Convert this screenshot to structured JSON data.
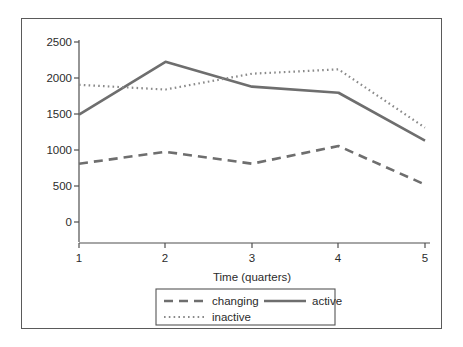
{
  "chart_data": {
    "type": "line",
    "title": "",
    "xlabel": "Time (quarters)",
    "ylabel": "",
    "x": [
      1,
      2,
      3,
      4,
      5
    ],
    "xtick_labels": [
      "1",
      "2",
      "3",
      "4",
      "5"
    ],
    "ytick_labels": [
      "0",
      "500",
      "1000",
      "1500",
      "2000",
      "2500"
    ],
    "ytick_values": [
      0,
      500,
      1000,
      1500,
      2000,
      2500
    ],
    "xlim": [
      1,
      5
    ],
    "ylim": [
      0,
      2500
    ],
    "grid": false,
    "legend_position": "bottom",
    "series": [
      {
        "name": "changing",
        "style": "dashed",
        "color": "#6e6e6e",
        "values": [
          810,
          975,
          810,
          1055,
          520
        ]
      },
      {
        "name": "active",
        "style": "solid",
        "color": "#6e6e6e",
        "values": [
          1490,
          2225,
          1880,
          1795,
          1130
        ]
      },
      {
        "name": "inactive",
        "style": "dotted",
        "color": "#8a8a8a",
        "values": [
          1905,
          1840,
          2060,
          2120,
          1310
        ]
      }
    ],
    "legend_entries": [
      {
        "label": "changing",
        "style": "dashed"
      },
      {
        "label": "active",
        "style": "solid"
      },
      {
        "label": "inactive",
        "style": "dotted"
      }
    ]
  },
  "colors": {
    "frame_border": "#5a5a5a",
    "axis": "#4f4f4f",
    "text": "#2b2b2b",
    "background": "#ffffff"
  }
}
